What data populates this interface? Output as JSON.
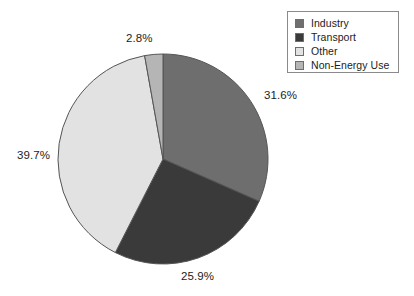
{
  "chart_data": {
    "type": "pie",
    "title": "",
    "subtitle": "",
    "xlabel": "",
    "ylabel": "",
    "grid": false,
    "legend_position": "top-right",
    "start_angle_deg": 0,
    "direction": "clockwise",
    "categories": [
      "Industry",
      "Transport",
      "Other",
      "Non-Energy Use"
    ],
    "values": [
      31.6,
      25.9,
      39.7,
      2.8
    ],
    "value_unit": "%",
    "data_labels": [
      "31.6%",
      "25.9%",
      "39.7%",
      "2.8%"
    ],
    "colors": [
      "#6e6e6e",
      "#3a3a3a",
      "#e2e2e2",
      "#b5b5b5"
    ],
    "slices": [
      {
        "name": "Industry",
        "value": 31.6,
        "label": "31.6%",
        "color": "#6e6e6e"
      },
      {
        "name": "Transport",
        "value": 25.9,
        "label": "25.9%",
        "color": "#3a3a3a"
      },
      {
        "name": "Other",
        "value": 39.7,
        "label": "39.7%",
        "color": "#e2e2e2"
      },
      {
        "name": "Non-Energy Use",
        "value": 2.8,
        "label": "2.8%",
        "color": "#b5b5b5"
      }
    ]
  },
  "pie": {
    "center_x": 163,
    "center_y": 159,
    "radius": 105,
    "outline_color": "#555555"
  },
  "labels": {
    "non_energy_use": "2.8%",
    "industry": "31.6%",
    "other": "39.7%",
    "transport": "25.9%"
  },
  "legend": {
    "items": [
      {
        "label": "Industry",
        "color": "#6e6e6e"
      },
      {
        "label": "Transport",
        "color": "#3a3a3a"
      },
      {
        "label": "Other",
        "color": "#e2e2e2"
      },
      {
        "label": "Non-Energy Use",
        "color": "#b5b5b5"
      }
    ]
  }
}
